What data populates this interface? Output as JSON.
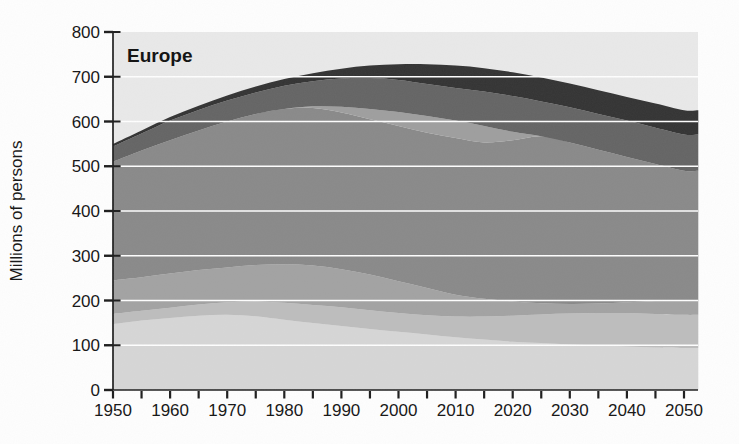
{
  "chart": {
    "title": "Europe",
    "ylabel": "Millions of persons",
    "plot_bg": "#e9e9e9",
    "gridline_color": "#ffffff",
    "axis_color": "#1c1c1c",
    "text_color": "#141414"
  },
  "chart_data": {
    "type": "area",
    "stacked": true,
    "title": "Europe",
    "xlabel": "",
    "ylabel": "Millions of persons",
    "xlim": [
      1950,
      2052.5
    ],
    "ylim": [
      0,
      800
    ],
    "grid": "horizontal-white",
    "legend": "none",
    "x_major_ticks": [
      1950,
      1960,
      1970,
      1980,
      1990,
      2000,
      2010,
      2020,
      2030,
      2040,
      2050
    ],
    "x_minor_step": 5,
    "y_ticks": [
      0,
      100,
      200,
      300,
      400,
      500,
      600,
      700,
      800
    ],
    "grid_y": [
      100,
      200,
      300,
      400,
      500,
      600,
      700
    ],
    "x": [
      1950,
      1955,
      1960,
      1965,
      1970,
      1975,
      1980,
      1985,
      1990,
      1995,
      2000,
      2005,
      2010,
      2015,
      2020,
      2025,
      2030,
      2035,
      2040,
      2045,
      2050
    ],
    "series": [
      {
        "name": "band-1",
        "color": "#d6d6d6",
        "cumulative_upper": [
          147,
          155,
          161,
          166,
          168,
          165,
          157,
          150,
          143,
          136,
          130,
          124,
          118,
          113,
          108,
          105,
          102,
          100,
          97,
          95,
          94
        ]
      },
      {
        "name": "band-2",
        "color": "#bdbdbd",
        "cumulative_upper": [
          170,
          177,
          184,
          191,
          196,
          198,
          195,
          190,
          185,
          178,
          172,
          167,
          164,
          164,
          166,
          169,
          171,
          172,
          172,
          170,
          168
        ]
      },
      {
        "name": "band-3",
        "color": "#a2a2a2",
        "cumulative_upper": [
          245,
          252,
          260,
          268,
          274,
          279,
          281,
          278,
          270,
          258,
          243,
          228,
          213,
          204,
          198,
          194,
          192,
          193,
          196,
          199,
          201
        ]
      },
      {
        "name": "band-4",
        "color": "#898989",
        "cumulative_upper": [
          510,
          535,
          558,
          580,
          600,
          617,
          628,
          630,
          620,
          605,
          590,
          575,
          563,
          553,
          558,
          567,
          553,
          537,
          521,
          505,
          490
        ]
      },
      {
        "name": "band-5",
        "color": "#9e9e9e",
        "cumulative_upper": [
          510,
          535,
          558,
          580,
          600,
          617,
          628,
          634,
          633,
          628,
          621,
          612,
          602,
          590,
          577,
          567,
          553,
          537,
          521,
          505,
          490
        ]
      },
      {
        "name": "band-6",
        "color": "#646464",
        "cumulative_upper": [
          544,
          573,
          602,
          626,
          647,
          665,
          680,
          690,
          696,
          697,
          693,
          684,
          675,
          667,
          657,
          645,
          632,
          617,
          602,
          586,
          571
        ]
      },
      {
        "name": "band-7",
        "color": "#333333",
        "cumulative_upper": [
          550,
          580,
          610,
          635,
          658,
          678,
          695,
          708,
          718,
          725,
          728,
          728,
          725,
          719,
          710,
          698,
          685,
          670,
          655,
          640,
          625
        ]
      }
    ]
  }
}
